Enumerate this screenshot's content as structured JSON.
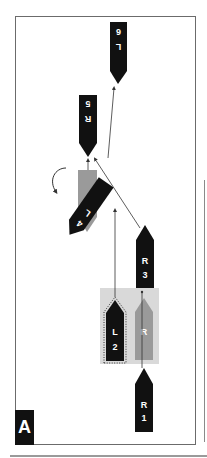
{
  "figure": {
    "panel_label": "A",
    "colors": {
      "boat_active": "#111111",
      "boat_ghost": "#9a9a9a",
      "zone": "#d9d9d9",
      "frame": "#6b6b6b",
      "arrow": "#333333"
    },
    "boats": [
      {
        "id": "R1",
        "letter": "R",
        "number": "1",
        "direction": "up",
        "style": "solid"
      },
      {
        "id": "L2",
        "letter": "L",
        "number": "2",
        "direction": "up",
        "style": "solid-dotted-outline"
      },
      {
        "id": "R-ghost",
        "letter": "R",
        "number": "",
        "direction": "up",
        "style": "ghost"
      },
      {
        "id": "R3",
        "letter": "R",
        "number": "3",
        "direction": "up",
        "style": "solid"
      },
      {
        "id": "L4",
        "letter": "L",
        "number": "4",
        "direction": "rotated",
        "style": "solid"
      },
      {
        "id": "L4-ghost",
        "letter": "",
        "number": "",
        "direction": "down",
        "style": "ghost"
      },
      {
        "id": "R5",
        "letter": "R",
        "number": "5",
        "direction": "down",
        "style": "solid"
      },
      {
        "id": "L6",
        "letter": "L",
        "number": "6",
        "direction": "down",
        "style": "solid"
      }
    ]
  }
}
